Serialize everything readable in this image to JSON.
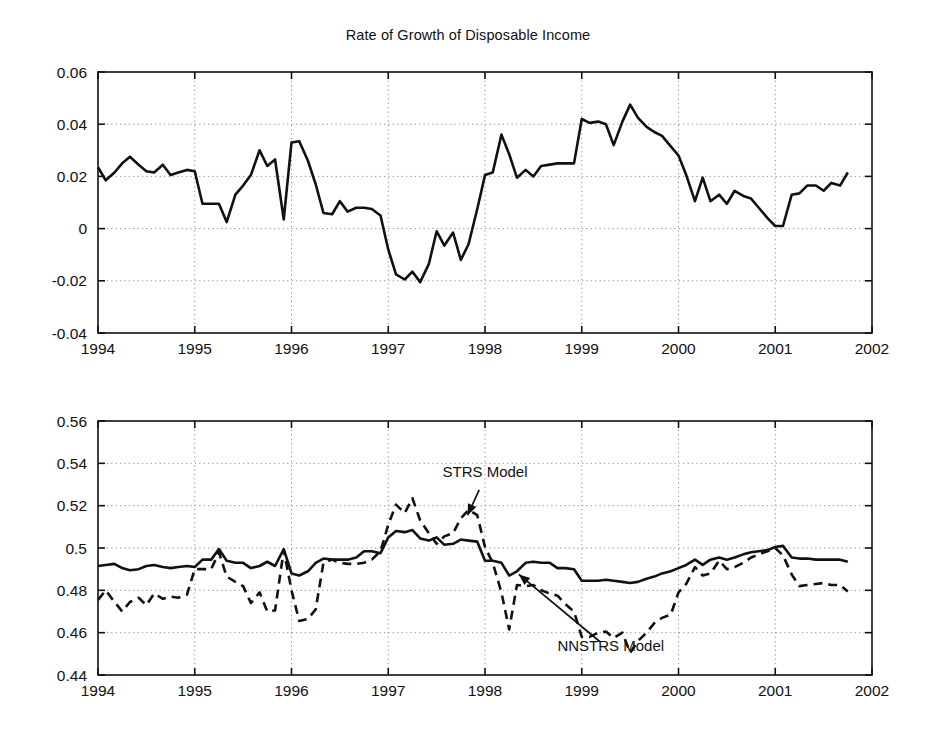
{
  "figure": {
    "background": "#ffffff",
    "ink": "#111111",
    "grid_color": "#8c8c8c"
  },
  "chart_data": [
    {
      "type": "line",
      "title": "Rate of Growth of Disposable Income",
      "xlabel": "",
      "ylabel": "",
      "xlim": [
        1994,
        2002
      ],
      "ylim": [
        -0.04,
        0.06
      ],
      "xticks": [
        1994,
        1995,
        1996,
        1997,
        1998,
        1999,
        2000,
        2001,
        2002
      ],
      "xtick_labels": [
        "1994",
        "1995",
        "1996",
        "1997",
        "1998",
        "1999",
        "2000",
        "2001",
        "2002"
      ],
      "yticks": [
        -0.04,
        -0.02,
        0,
        0.02,
        0.04,
        0.06
      ],
      "ytick_labels": [
        "-0.04",
        "-0.02",
        "0",
        "0.02",
        "0.04",
        "0.06"
      ],
      "grid": true,
      "grid_style": "dotted",
      "legend": "none",
      "series": [
        {
          "name": "Rate of growth of disposable income",
          "style": "solid",
          "color": "#111111",
          "x": [
            1994.0,
            1994.08,
            1994.17,
            1994.25,
            1994.33,
            1994.42,
            1994.5,
            1994.58,
            1994.67,
            1994.75,
            1994.83,
            1994.92,
            1995.0,
            1995.08,
            1995.17,
            1995.25,
            1995.33,
            1995.42,
            1995.5,
            1995.58,
            1995.67,
            1995.75,
            1995.83,
            1995.92,
            1996.0,
            1996.08,
            1996.17,
            1996.25,
            1996.33,
            1996.42,
            1996.5,
            1996.58,
            1996.67,
            1996.75,
            1996.83,
            1996.92,
            1997.0,
            1997.08,
            1997.17,
            1997.25,
            1997.33,
            1997.42,
            1997.5,
            1997.58,
            1997.67,
            1997.75,
            1997.83,
            1997.92,
            1998.0,
            1998.08,
            1998.17,
            1998.25,
            1998.33,
            1998.42,
            1998.5,
            1998.58,
            1998.67,
            1998.75,
            1998.83,
            1998.92,
            1999.0,
            1999.08,
            1999.17,
            1999.25,
            1999.33,
            1999.42,
            1999.5,
            1999.58,
            1999.67,
            1999.75,
            1999.83,
            1999.92,
            2000.0,
            2000.08,
            2000.17,
            2000.25,
            2000.33,
            2000.42,
            2000.5,
            2000.58,
            2000.67,
            2000.75,
            2000.83,
            2000.92,
            2001.0,
            2001.08,
            2001.17,
            2001.25,
            2001.33,
            2001.42,
            2001.5,
            2001.58,
            2001.67,
            2001.75
          ],
          "y": [
            0.0235,
            0.0185,
            0.0215,
            0.025,
            0.0275,
            0.0245,
            0.022,
            0.0215,
            0.0245,
            0.0205,
            0.0215,
            0.0225,
            0.022,
            0.0095,
            0.0095,
            0.0095,
            0.0025,
            0.013,
            0.0165,
            0.0205,
            0.03,
            0.024,
            0.0265,
            0.0035,
            0.033,
            0.0335,
            0.026,
            0.017,
            0.006,
            0.0055,
            0.0105,
            0.0065,
            0.008,
            0.008,
            0.0075,
            0.005,
            -0.008,
            -0.0175,
            -0.0195,
            -0.0165,
            -0.0205,
            -0.0135,
            -0.001,
            -0.0065,
            -0.0015,
            -0.012,
            -0.006,
            0.0075,
            0.0205,
            0.0215,
            0.036,
            0.0285,
            0.0195,
            0.0225,
            0.02,
            0.024,
            0.0245,
            0.025,
            0.025,
            0.025,
            0.042,
            0.0405,
            0.041,
            0.04,
            0.032,
            0.041,
            0.0475,
            0.0425,
            0.039,
            0.037,
            0.0355,
            0.0315,
            0.028,
            0.0205,
            0.0105,
            0.0195,
            0.0105,
            0.013,
            0.0095,
            0.0145,
            0.0125,
            0.0115,
            0.008,
            0.004,
            0.001,
            0.001,
            0.013,
            0.0135,
            0.0165,
            0.0165,
            0.0145,
            0.0175,
            0.0165,
            0.0215
          ]
        }
      ]
    },
    {
      "type": "line",
      "title": "Transition Neurons",
      "xlabel": "",
      "ylabel": "",
      "xlim": [
        1994,
        2002
      ],
      "ylim": [
        0.44,
        0.56
      ],
      "xticks": [
        1994,
        1995,
        1996,
        1997,
        1998,
        1999,
        2000,
        2001,
        2002
      ],
      "xtick_labels": [
        "1994",
        "1995",
        "1996",
        "1997",
        "1998",
        "1999",
        "2000",
        "2001",
        "2002"
      ],
      "yticks": [
        0.44,
        0.46,
        0.48,
        0.5,
        0.52,
        0.54,
        0.56
      ],
      "ytick_labels": [
        "0.44",
        "0.46",
        "0.48",
        "0.5",
        "0.52",
        "0.54",
        "0.56"
      ],
      "grid": true,
      "grid_style": "dotted",
      "legend": "annotations",
      "annotations": [
        {
          "text": "STRS Model",
          "text_x": 1998.0,
          "text_y": 0.5335,
          "arrow_to_x": 1997.82,
          "arrow_to_y": 0.5155
        },
        {
          "text": "NNSTRS Model",
          "text_x": 1999.3,
          "text_y": 0.4515,
          "arrow_to_x": 1998.35,
          "arrow_to_y": 0.4875
        }
      ],
      "series": [
        {
          "name": "STRS Model",
          "style": "solid",
          "color": "#111111",
          "x": [
            1994.0,
            1994.08,
            1994.17,
            1994.25,
            1994.33,
            1994.42,
            1994.5,
            1994.58,
            1994.67,
            1994.75,
            1994.83,
            1994.92,
            1995.0,
            1995.08,
            1995.17,
            1995.25,
            1995.33,
            1995.42,
            1995.5,
            1995.58,
            1995.67,
            1995.75,
            1995.83,
            1995.92,
            1996.0,
            1996.08,
            1996.17,
            1996.25,
            1996.33,
            1996.42,
            1996.5,
            1996.58,
            1996.67,
            1996.75,
            1996.83,
            1996.92,
            1997.0,
            1997.08,
            1997.17,
            1997.25,
            1997.33,
            1997.42,
            1997.5,
            1997.58,
            1997.67,
            1997.75,
            1997.83,
            1997.92,
            1998.0,
            1998.08,
            1998.17,
            1998.25,
            1998.33,
            1998.42,
            1998.5,
            1998.58,
            1998.67,
            1998.75,
            1998.83,
            1998.92,
            1999.0,
            1999.08,
            1999.17,
            1999.25,
            1999.33,
            1999.42,
            1999.5,
            1999.58,
            1999.67,
            1999.75,
            1999.83,
            1999.92,
            2000.0,
            2000.08,
            2000.17,
            2000.25,
            2000.33,
            2000.42,
            2000.5,
            2000.58,
            2000.67,
            2000.75,
            2000.83,
            2000.92,
            2001.0,
            2001.08,
            2001.17,
            2001.25,
            2001.33,
            2001.42,
            2001.5,
            2001.58,
            2001.67,
            2001.75
          ],
          "y": [
            0.4915,
            0.492,
            0.4925,
            0.4905,
            0.4895,
            0.49,
            0.4915,
            0.492,
            0.491,
            0.4905,
            0.491,
            0.4915,
            0.491,
            0.4945,
            0.4945,
            0.4995,
            0.494,
            0.493,
            0.493,
            0.4905,
            0.4915,
            0.4935,
            0.4915,
            0.4995,
            0.488,
            0.487,
            0.489,
            0.493,
            0.495,
            0.4945,
            0.4945,
            0.4945,
            0.4955,
            0.4985,
            0.4985,
            0.4975,
            0.505,
            0.508,
            0.5075,
            0.5085,
            0.5045,
            0.5035,
            0.505,
            0.5015,
            0.502,
            0.504,
            0.5035,
            0.503,
            0.494,
            0.494,
            0.493,
            0.487,
            0.489,
            0.493,
            0.4935,
            0.493,
            0.493,
            0.4905,
            0.4905,
            0.49,
            0.4845,
            0.4845,
            0.4845,
            0.485,
            0.4845,
            0.484,
            0.4835,
            0.484,
            0.4855,
            0.4865,
            0.488,
            0.489,
            0.4905,
            0.492,
            0.4945,
            0.492,
            0.4945,
            0.4955,
            0.4945,
            0.4955,
            0.497,
            0.498,
            0.4985,
            0.499,
            0.5005,
            0.501,
            0.4955,
            0.495,
            0.495,
            0.4945,
            0.4945,
            0.4945,
            0.4945,
            0.4935
          ]
        },
        {
          "name": "NNSTRS Model",
          "style": "dashed",
          "color": "#111111",
          "x": [
            1994.0,
            1994.08,
            1994.17,
            1994.25,
            1994.33,
            1994.42,
            1994.5,
            1994.58,
            1994.67,
            1994.75,
            1994.83,
            1994.92,
            1995.0,
            1995.08,
            1995.17,
            1995.25,
            1995.33,
            1995.42,
            1995.5,
            1995.58,
            1995.67,
            1995.75,
            1995.83,
            1995.92,
            1996.0,
            1996.08,
            1996.17,
            1996.25,
            1996.33,
            1996.42,
            1996.5,
            1996.58,
            1996.67,
            1996.75,
            1996.83,
            1996.92,
            1997.0,
            1997.08,
            1997.17,
            1997.25,
            1997.33,
            1997.42,
            1997.5,
            1997.58,
            1997.67,
            1997.75,
            1997.83,
            1997.92,
            1998.0,
            1998.08,
            1998.17,
            1998.25,
            1998.33,
            1998.42,
            1998.5,
            1998.58,
            1998.67,
            1998.75,
            1998.83,
            1998.92,
            1999.0,
            1999.08,
            1999.17,
            1999.25,
            1999.33,
            1999.42,
            1999.5,
            1999.58,
            1999.67,
            1999.75,
            1999.83,
            1999.92,
            2000.0,
            2000.08,
            2000.17,
            2000.25,
            2000.33,
            2000.42,
            2000.5,
            2000.58,
            2000.67,
            2000.75,
            2000.83,
            2000.92,
            2001.0,
            2001.08,
            2001.17,
            2001.25,
            2001.33,
            2001.42,
            2001.5,
            2001.58,
            2001.67,
            2001.75
          ],
          "y": [
            0.4755,
            0.48,
            0.4745,
            0.47,
            0.4745,
            0.4765,
            0.473,
            0.4785,
            0.476,
            0.477,
            0.4765,
            0.478,
            0.49,
            0.49,
            0.49,
            0.498,
            0.4865,
            0.484,
            0.482,
            0.474,
            0.479,
            0.47,
            0.4705,
            0.499,
            0.48,
            0.4655,
            0.4665,
            0.471,
            0.493,
            0.4945,
            0.493,
            0.4925,
            0.4925,
            0.493,
            0.4945,
            0.4985,
            0.511,
            0.5205,
            0.5165,
            0.5235,
            0.513,
            0.507,
            0.502,
            0.5055,
            0.507,
            0.514,
            0.518,
            0.5155,
            0.5005,
            0.493,
            0.479,
            0.4615,
            0.4825,
            0.482,
            0.4825,
            0.48,
            0.4785,
            0.4775,
            0.4735,
            0.47,
            0.458,
            0.458,
            0.46,
            0.4605,
            0.4575,
            0.46,
            0.4505,
            0.456,
            0.46,
            0.4645,
            0.467,
            0.4685,
            0.479,
            0.483,
            0.491,
            0.487,
            0.488,
            0.494,
            0.49,
            0.491,
            0.493,
            0.4955,
            0.497,
            0.4985,
            0.5,
            0.4965,
            0.4875,
            0.482,
            0.4825,
            0.483,
            0.4835,
            0.4825,
            0.4825,
            0.4795
          ]
        }
      ]
    }
  ]
}
